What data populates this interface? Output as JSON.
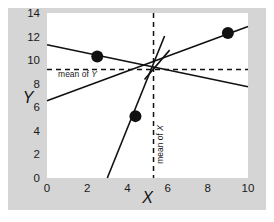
{
  "chart_data": {
    "type": "scatter",
    "title": "",
    "subtitle": "",
    "xlabel": "X",
    "ylabel": "Y",
    "xlim": [
      0,
      10
    ],
    "ylim": [
      0,
      14
    ],
    "x_ticks": [
      "0",
      "2",
      "4",
      "6",
      "8",
      "10"
    ],
    "y_ticks": [
      "0",
      "2",
      "4",
      "6",
      "8",
      "10",
      "12",
      "14"
    ],
    "x_tick_values": [
      0,
      2,
      4,
      6,
      8,
      10
    ],
    "y_tick_values": [
      0,
      2,
      4,
      6,
      8,
      10,
      12,
      14
    ],
    "grid": false,
    "legend": "none",
    "points": [
      {
        "x": 2.5,
        "y": 10.3
      },
      {
        "x": 4.4,
        "y": 5.25
      },
      {
        "x": 9.0,
        "y": 12.3
      }
    ],
    "mean_x": 5.3,
    "mean_y": 9.2,
    "annotations": [
      {
        "text_prefix": "mean of ",
        "text_var": "Y",
        "x": 0.55,
        "y": 8.55,
        "rotation": 0
      },
      {
        "text_prefix": "mean of ",
        "text_var": "X",
        "x": 5.75,
        "y": 1.2,
        "rotation": -90
      }
    ],
    "series": [
      {
        "name": "shallow-descending-line",
        "x": [
          0,
          10
        ],
        "y": [
          11.3,
          7.75
        ]
      },
      {
        "name": "moderate-ascending-line",
        "x": [
          0,
          10
        ],
        "y": [
          6.55,
          12.85
        ]
      },
      {
        "name": "steep-ascending-line",
        "x": [
          3.0,
          5.85
        ],
        "y": [
          0,
          12.05
        ]
      },
      {
        "name": "short-steep-segment",
        "x": [
          4.85,
          6.1
        ],
        "y": [
          8.35,
          10.85
        ]
      }
    ]
  },
  "axes": {
    "x_title": "X",
    "y_title": "Y"
  },
  "labels": {
    "mean_of": "mean of ",
    "y_var": "Y",
    "x_var": "X"
  },
  "colors": {
    "panel_background": "#d5d5d5",
    "plot_background": "#ffffff",
    "line": "#111111",
    "point": "#111111",
    "text": "#1a1a1a"
  }
}
